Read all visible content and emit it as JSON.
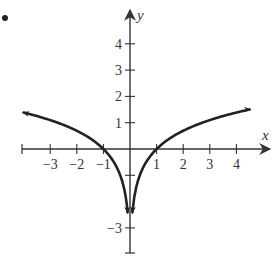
{
  "figure": {
    "bullet": "•",
    "colors": {
      "axis": "#333333",
      "curve": "#222222",
      "text": "#333333",
      "background": "#ffffff"
    }
  },
  "chart_data": {
    "type": "line",
    "title": "",
    "xlabel": "x",
    "ylabel": "y",
    "function": "y = ln|x|",
    "xlim": [
      -4,
      5
    ],
    "ylim": [
      -4,
      5
    ],
    "grid": false,
    "legend": null,
    "x_ticks": [
      -3,
      -2,
      -1,
      1,
      2,
      3,
      4
    ],
    "x_tick_labels": [
      "−3",
      "−2",
      "−1",
      "1",
      "2",
      "3",
      "4"
    ],
    "y_ticks": [
      4,
      3,
      2,
      1,
      -1,
      -3
    ],
    "y_tick_labels": [
      "4",
      "3",
      "2",
      "1",
      "",
      "−3"
    ],
    "series": [
      {
        "name": "left branch",
        "x": [
          -4.0,
          -3.5,
          -3.0,
          -2.5,
          -2.0,
          -1.5,
          -1.0,
          -0.7,
          -0.5,
          -0.3,
          -0.2,
          -0.12,
          -0.09
        ],
        "y": [
          1.39,
          1.25,
          1.1,
          0.92,
          0.69,
          0.41,
          0.0,
          -0.36,
          -0.69,
          -1.2,
          -1.61,
          -2.12,
          -2.41
        ],
        "arrow_ends": "both"
      },
      {
        "name": "right branch",
        "x": [
          0.09,
          0.12,
          0.2,
          0.3,
          0.5,
          0.7,
          1.0,
          1.5,
          2.0,
          2.5,
          3.0,
          3.5,
          4.0,
          4.5
        ],
        "y": [
          -2.41,
          -2.12,
          -1.61,
          -1.2,
          -0.69,
          -0.36,
          0.0,
          0.41,
          0.69,
          0.92,
          1.1,
          1.25,
          1.39,
          1.5
        ],
        "arrow_ends": "both"
      }
    ],
    "annotations": [
      "Curve crosses x-axis at x = −1 and x = 1",
      "Vertical asymptote at x = 0 (both branches go to −∞)"
    ]
  }
}
